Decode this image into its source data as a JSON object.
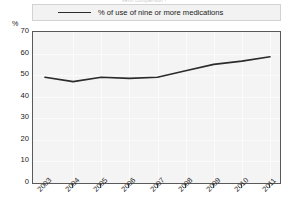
{
  "chart_data": {
    "type": "line",
    "title": "Venn comparison -",
    "ylabel": "%",
    "xlabel": "",
    "ylim": [
      0,
      70
    ],
    "ytick_step": 10,
    "yticks": [
      "70",
      "60",
      "50",
      "40",
      "30",
      "20",
      "10",
      "0"
    ],
    "categories": [
      "2003",
      "2004",
      "2005",
      "2006",
      "2007",
      "2008",
      "2009",
      "2010",
      "2011"
    ],
    "series": [
      {
        "name": "% of use of nine or more medications",
        "values": [
          49,
          47,
          49,
          48.5,
          49,
          52,
          55,
          56.5,
          58.5
        ],
        "color": "#2b2b2b"
      }
    ],
    "legend_position": "top",
    "grid": true
  },
  "legend": {
    "label": "% of use of nine or more medications",
    "swatch_name": "line-swatch"
  },
  "axes": {
    "y_unit": "%"
  },
  "colors": {
    "line": "#2b2b2b",
    "plot_background": "#f4f4f4",
    "legend_background": "#f2f2f2",
    "axis": "#5a5a5a",
    "gridline": "#fbfbfb",
    "text": "#1a1a1a"
  }
}
